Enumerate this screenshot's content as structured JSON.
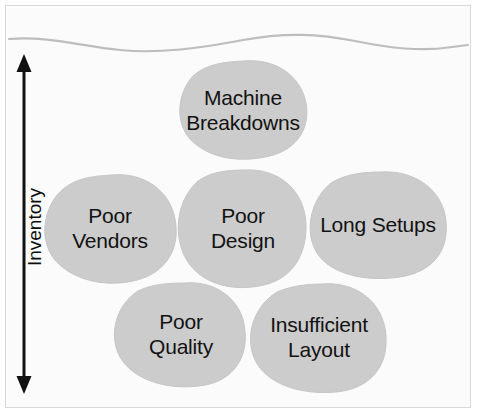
{
  "diagram": {
    "background_color": "#fbfbfb",
    "frame_color": "#d8d8d8",
    "blob_fill_color": "#cccccc",
    "blob_stroke_color": "#c4c4c4",
    "waterline_color": "#b9b9b9",
    "text_color": "#121212",
    "arrow_color": "#111111"
  },
  "axis": {
    "label": "Inventory",
    "orientation": "vertical-rotated-90",
    "arrow_type": "double-headed",
    "arrow_top_y": 58,
    "arrow_bottom_y": 390
  },
  "waterline": {
    "name": "water-level-line",
    "description": "wavy horizontal line near top representing the water (inventory) level"
  },
  "blobs": [
    {
      "id": "machine-breakdowns",
      "label": "Machine\nBreakdowns",
      "lines": [
        "Machine",
        "Breakdowns"
      ],
      "cx": 243,
      "cy": 110,
      "rx": 63,
      "ry": 49,
      "label_left": 173,
      "label_top": 85,
      "label_width": 140
    },
    {
      "id": "poor-vendors",
      "label": "Poor\nVendors",
      "lines": [
        "Poor",
        "Vendors"
      ],
      "cx": 110,
      "cy": 228,
      "rx": 65,
      "ry": 53,
      "label_left": 42,
      "label_top": 203,
      "label_width": 136
    },
    {
      "id": "poor-design",
      "label": "Poor\nDesign",
      "lines": [
        "Poor",
        "Design"
      ],
      "cx": 243,
      "cy": 228,
      "rx": 63,
      "ry": 58,
      "label_left": 175,
      "label_top": 203,
      "label_width": 136
    },
    {
      "id": "long-setups",
      "label": "Long Setups",
      "lines": [
        "Long Setups"
      ],
      "cx": 378,
      "cy": 224,
      "rx": 68,
      "ry": 52,
      "label_left": 306,
      "label_top": 212,
      "label_width": 144
    },
    {
      "id": "poor-quality",
      "label": "Poor\nQuality",
      "lines": [
        "Poor",
        "Quality"
      ],
      "cx": 181,
      "cy": 334,
      "rx": 64,
      "ry": 52,
      "label_left": 113,
      "label_top": 309,
      "label_width": 136
    },
    {
      "id": "insufficient-layout",
      "label": "Insufficient\nLayout",
      "lines": [
        "Insufficient",
        "Layout"
      ],
      "cx": 319,
      "cy": 337,
      "rx": 67,
      "ry": 54,
      "label_left": 249,
      "label_top": 312,
      "label_width": 140
    }
  ]
}
